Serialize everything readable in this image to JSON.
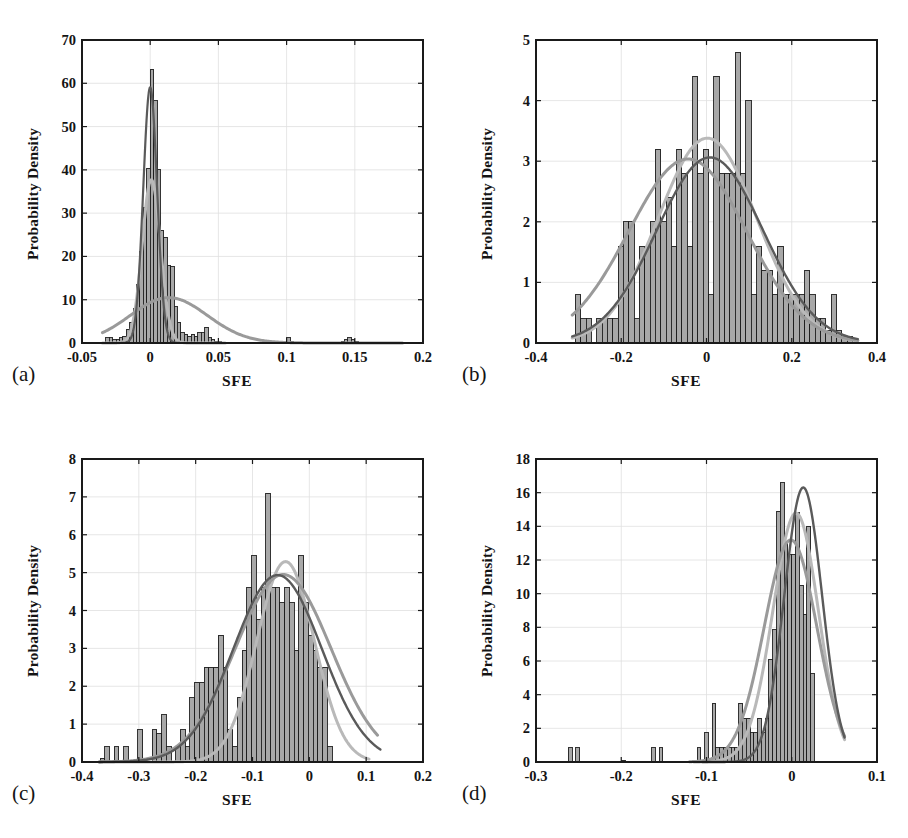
{
  "figure": {
    "layout": "2x2 grid of histogram panels",
    "panel_count": 4
  },
  "chart_data": [
    {
      "panel": "a",
      "panel_letter": "(a)",
      "type": "bar",
      "title": "",
      "xlabel": "SFE",
      "ylabel": "Probability Density",
      "xlim": [
        -0.05,
        0.2
      ],
      "ylim": [
        0,
        70
      ],
      "xticks": [
        -0.05,
        0,
        0.05,
        0.1,
        0.15,
        0.2
      ],
      "xticklabels": [
        "-0.05",
        "0",
        "0.05",
        "0.1",
        "0.15",
        "0.2"
      ],
      "yticks": [
        0,
        10,
        20,
        30,
        40,
        50,
        60,
        70
      ],
      "yticklabels": [
        "0",
        "10",
        "20",
        "30",
        "40",
        "50",
        "60",
        "70"
      ],
      "grid": true,
      "bin_width": 0.0025,
      "bin_starts": [
        -0.0325,
        -0.03,
        -0.0275,
        -0.025,
        -0.0225,
        -0.02,
        -0.0175,
        -0.015,
        -0.0125,
        -0.01,
        -0.0075,
        -0.005,
        -0.0025,
        0.0,
        0.0025,
        0.005,
        0.0075,
        0.01,
        0.0125,
        0.015,
        0.0175,
        0.02,
        0.0225,
        0.025,
        0.0275,
        0.03,
        0.0325,
        0.035,
        0.0375,
        0.04,
        0.0425,
        0.045,
        0.0475,
        0.05,
        0.0975,
        0.1,
        0.1025,
        0.14,
        0.1425,
        0.145,
        0.1475,
        0.15
      ],
      "values": [
        1.2,
        1.2,
        0.8,
        0.8,
        1.2,
        1.6,
        3.2,
        4.8,
        8.0,
        13.6,
        21.2,
        31.2,
        40.4,
        63.2,
        56.0,
        40.0,
        26.0,
        24.4,
        18.0,
        17.6,
        8.4,
        4.8,
        2.4,
        2.0,
        1.6,
        2.0,
        1.6,
        2.4,
        2.4,
        3.6,
        1.2,
        0.8,
        0.4,
        0.4,
        0.4,
        1.2,
        0.4,
        0.4,
        0.8,
        1.2,
        0.8,
        0.4
      ],
      "curves": [
        {
          "name": "fit-light-gray",
          "color": "#b9b9b9",
          "peak_x": 0.0,
          "peak_y": 37.0,
          "note": "narrow unimodal fit peaking near 37"
        },
        {
          "name": "fit-medium-gray",
          "color": "#9a9a9a",
          "peak_x": 0.012,
          "peak_y": 9.8,
          "note": "broad shallow fit peaking near 10"
        },
        {
          "name": "fit-dark-gray",
          "color": "#595959",
          "peak_x": -0.001,
          "peak_y": 57.0,
          "note": "narrow unimodal fit peaking near 57"
        }
      ]
    },
    {
      "panel": "b",
      "panel_letter": "(b)",
      "type": "bar",
      "title": "",
      "xlabel": "SFE",
      "ylabel": "Probability Density",
      "xlim": [
        -0.4,
        0.4
      ],
      "ylim": [
        0,
        5
      ],
      "xticks": [
        -0.4,
        -0.2,
        0,
        0.2,
        0.4
      ],
      "xticklabels": [
        "-0.4",
        "-0.2",
        "0",
        "0.2",
        "0.4"
      ],
      "yticks": [
        0,
        1,
        2,
        3,
        4,
        5
      ],
      "yticklabels": [
        "0",
        "1",
        "2",
        "3",
        "4",
        "5"
      ],
      "grid": true,
      "bin_width": 0.0125,
      "bin_starts": [
        -0.3075,
        -0.295,
        -0.2825,
        -0.27,
        -0.2575,
        -0.245,
        -0.2325,
        -0.22,
        -0.2075,
        -0.195,
        -0.1825,
        -0.17,
        -0.1575,
        -0.145,
        -0.1325,
        -0.12,
        -0.1075,
        -0.095,
        -0.0825,
        -0.07,
        -0.0575,
        -0.045,
        -0.0325,
        -0.02,
        -0.0075,
        0.005,
        0.0175,
        0.03,
        0.0425,
        0.055,
        0.0675,
        0.08,
        0.0925,
        0.105,
        0.1175,
        0.13,
        0.1425,
        0.155,
        0.1675,
        0.18,
        0.1925,
        0.205,
        0.2175,
        0.23,
        0.2425,
        0.255,
        0.2675,
        0.28,
        0.2925,
        0.305,
        0.3175,
        0.33
      ],
      "values": [
        0.8,
        0.4,
        0.4,
        0.0,
        0.4,
        0.4,
        0.4,
        0.4,
        1.6,
        2.0,
        2.0,
        0.4,
        1.6,
        1.6,
        2.0,
        3.2,
        2.0,
        2.4,
        1.6,
        3.2,
        2.8,
        1.6,
        4.4,
        2.8,
        3.2,
        0.8,
        4.4,
        2.8,
        2.8,
        2.8,
        4.8,
        2.8,
        4.0,
        0.8,
        1.6,
        1.2,
        1.2,
        0.8,
        1.6,
        0.8,
        0.8,
        0.8,
        0.8,
        1.2,
        0.8,
        0.4,
        0.4,
        0.2,
        0.8,
        0.2,
        0.1,
        0.1
      ],
      "curves": [
        {
          "name": "fit-light-gray",
          "color": "#b9b9b9",
          "peak_x": -0.015,
          "peak_y": 3.3,
          "note": "gaussian-like, peaks ~3.3"
        },
        {
          "name": "fit-medium-gray",
          "color": "#9a9a9a",
          "peak_x": 0.09,
          "peak_y": 2.75,
          "note": "right-shifted broad fit"
        },
        {
          "name": "fit-dark-gray",
          "color": "#595959",
          "peak_x": 0.005,
          "peak_y": 3.05,
          "note": "gaussian-like, peaks ~3.05"
        }
      ]
    },
    {
      "panel": "c",
      "panel_letter": "(c)",
      "type": "bar",
      "title": "",
      "xlabel": "SFE",
      "ylabel": "Probability Density",
      "xlim": [
        -0.4,
        0.2
      ],
      "ylim": [
        0,
        8
      ],
      "xticks": [
        -0.4,
        -0.3,
        -0.2,
        -0.1,
        0,
        0.1,
        0.2
      ],
      "xticklabels": [
        "-0.4",
        "-0.3",
        "-0.2",
        "-0.1",
        "0",
        "0.1",
        "0.2"
      ],
      "yticks": [
        0,
        1,
        2,
        3,
        4,
        5,
        6,
        7,
        8
      ],
      "yticklabels": [
        "0",
        "1",
        "2",
        "3",
        "4",
        "5",
        "6",
        "7",
        "8"
      ],
      "grid": true,
      "bin_width": 0.00833,
      "bin_starts": [
        -0.3683,
        -0.36,
        -0.3517,
        -0.3433,
        -0.335,
        -0.3267,
        -0.3183,
        -0.31,
        -0.3017,
        -0.2933,
        -0.285,
        -0.2767,
        -0.2683,
        -0.26,
        -0.2517,
        -0.2433,
        -0.235,
        -0.2267,
        -0.2183,
        -0.21,
        -0.2017,
        -0.1933,
        -0.185,
        -0.1767,
        -0.1683,
        -0.16,
        -0.1517,
        -0.1433,
        -0.135,
        -0.1267,
        -0.1183,
        -0.11,
        -0.1017,
        -0.0933,
        -0.085,
        -0.0767,
        -0.0683,
        -0.06,
        -0.0517,
        -0.0433,
        -0.035,
        -0.0267,
        -0.0183,
        -0.01,
        -0.0017,
        0.0067,
        0.015,
        0.0233,
        0.0317,
        0.04,
        0.0483,
        0.0567,
        0.065,
        0.0733,
        0.0817,
        0.09,
        0.0983
      ],
      "values": [
        0.1,
        0.4,
        0.0,
        0.4,
        0.0,
        0.4,
        0.0,
        0.0,
        0.85,
        0.0,
        0.0,
        0.85,
        0.75,
        1.25,
        0.4,
        0.0,
        0.4,
        0.85,
        0.4,
        1.7,
        2.1,
        2.1,
        2.5,
        2.5,
        2.5,
        3.35,
        2.5,
        0.85,
        0.4,
        1.7,
        2.95,
        4.6,
        5.45,
        3.75,
        4.6,
        7.1,
        4.6,
        4.6,
        4.2,
        4.6,
        4.2,
        2.95,
        5.45,
        4.2,
        3.35,
        2.95,
        2.5,
        2.5,
        0.4,
        0.0,
        0.0,
        0.0,
        0.0,
        0.0,
        0.0,
        0.0,
        0.0
      ],
      "curves": [
        {
          "name": "fit-light-gray",
          "color": "#b9b9b9",
          "peak_x": -0.028,
          "peak_y": 5.1,
          "note": "narrower fit peaking near 5.1"
        },
        {
          "name": "fit-medium-gray",
          "color": "#9a9a9a",
          "peak_x": -0.055,
          "peak_y": 4.85,
          "note": "broad fit"
        },
        {
          "name": "fit-dark-gray",
          "color": "#595959",
          "peak_x": -0.06,
          "peak_y": 4.9,
          "note": "broad skewed fit"
        }
      ]
    },
    {
      "panel": "d",
      "panel_letter": "(d)",
      "type": "bar",
      "title": "",
      "xlabel": "SFE",
      "ylabel": "Probability Density",
      "xlim": [
        -0.3,
        0.1
      ],
      "ylim": [
        0,
        18
      ],
      "xticks": [
        -0.3,
        -0.2,
        -0.1,
        0,
        0.1
      ],
      "xticklabels": [
        "-0.3",
        "-0.2",
        "-0.1",
        "0",
        "0.1"
      ],
      "yticks": [
        0,
        2,
        4,
        6,
        8,
        10,
        12,
        14,
        16,
        18
      ],
      "yticklabels": [
        "0",
        "2",
        "4",
        "6",
        "8",
        "10",
        "12",
        "14",
        "16",
        "18"
      ],
      "grid": true,
      "bin_width": 0.00444,
      "bin_starts": [
        -0.2622,
        -0.2578,
        -0.2533,
        -0.2489,
        -0.2444,
        -0.2,
        -0.1956,
        -0.1644,
        -0.16,
        -0.1556,
        -0.1511,
        -0.1467,
        -0.1422,
        -0.1111,
        -0.1067,
        -0.1022,
        -0.0978,
        -0.0933,
        -0.0889,
        -0.0844,
        -0.08,
        -0.0756,
        -0.0711,
        -0.0667,
        -0.0622,
        -0.0578,
        -0.0533,
        -0.0489,
        -0.0444,
        -0.04,
        -0.0356,
        -0.0311,
        -0.0267,
        -0.0222,
        -0.0178,
        -0.0133,
        -0.0089,
        -0.0044,
        0.0,
        0.0044,
        0.0089,
        0.0133,
        0.0178,
        0.0222,
        0.0267,
        0.0311,
        0.0356,
        0.04,
        0.0444,
        0.0489,
        0.0533,
        0.0578
      ],
      "values": [
        0.85,
        0.0,
        0.85,
        0.0,
        0.0,
        0.1,
        0.0,
        0.85,
        0.0,
        0.85,
        0.0,
        0.0,
        0.0,
        0.85,
        0.0,
        1.75,
        0.0,
        3.5,
        0.85,
        0.85,
        0.85,
        0.85,
        0.85,
        0.85,
        3.5,
        2.6,
        2.6,
        1.75,
        1.75,
        2.6,
        1.75,
        2.6,
        6.1,
        7.85,
        14.9,
        16.6,
        13.1,
        12.3,
        12.3,
        14.8,
        10.5,
        8.75,
        14.0,
        5.25,
        0.0,
        0.0,
        0.0,
        0.0,
        0.0,
        0.0,
        0.0,
        0.0
      ],
      "curves": [
        {
          "name": "fit-light-gray",
          "color": "#b9b9b9",
          "peak_x": 0.018,
          "peak_y": 12.5,
          "note": "sharply rising fit peaking ~12.5"
        },
        {
          "name": "fit-medium-gray",
          "color": "#9a9a9a",
          "peak_x": 0.012,
          "peak_y": 11.6,
          "note": "fit peaking ~11.6"
        },
        {
          "name": "fit-dark-gray",
          "color": "#595959",
          "peak_x": 0.02,
          "peak_y": 15.3,
          "note": "tall narrow fit peaking ~15.3"
        }
      ]
    }
  ],
  "style": {
    "bar_fill": "#a8a8a8",
    "bar_edge": "#1e1e1e",
    "axis_color": "#1a1a1a",
    "grid_color": "#e0e0e0",
    "text_color": "#141414"
  }
}
